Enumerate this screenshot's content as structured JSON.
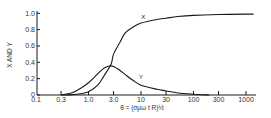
{
  "chart_data": {
    "type": "line",
    "title": "",
    "xlabel": "θ = (σμω t R)½",
    "ylabel": "X AND Y",
    "xscale": "log",
    "xlim": [
      0.1,
      1500
    ],
    "ylim": [
      0,
      1.0
    ],
    "grid": false,
    "legend": "inline labels",
    "x_ticks": [
      0.1,
      0.3,
      1.0,
      3.0,
      10,
      30,
      100,
      300,
      1000
    ],
    "x_tick_labels": [
      "0.1",
      "0.3",
      "1.0",
      "3.0",
      "10",
      "30",
      "100",
      "300",
      "1000"
    ],
    "y_ticks": [
      0,
      0.2,
      0.4,
      0.6,
      0.8,
      1.0
    ],
    "y_tick_labels": [
      "0",
      "0.2",
      "0.4",
      "0.6",
      "0.8",
      "1.0"
    ],
    "series": [
      {
        "name": "X",
        "label_at": [
          11,
          0.93
        ],
        "x": [
          0.3,
          0.5,
          0.7,
          1.0,
          1.5,
          2.0,
          2.7,
          3.0,
          4.0,
          5.0,
          7.0,
          10,
          20,
          30,
          50,
          100,
          300,
          1000,
          1400
        ],
        "values": [
          0.0,
          0.005,
          0.015,
          0.04,
          0.12,
          0.24,
          0.38,
          0.5,
          0.65,
          0.76,
          0.83,
          0.88,
          0.925,
          0.94,
          0.96,
          0.975,
          0.985,
          0.99,
          0.99
        ]
      },
      {
        "name": "Y",
        "label_at": [
          10,
          0.19
        ],
        "x": [
          0.3,
          0.5,
          0.7,
          1.0,
          1.5,
          2.0,
          2.5,
          3.0,
          4.0,
          5.0,
          7.0,
          10,
          20,
          30,
          50,
          100,
          200
        ],
        "values": [
          0.0,
          0.03,
          0.08,
          0.15,
          0.26,
          0.33,
          0.355,
          0.35,
          0.3,
          0.25,
          0.18,
          0.12,
          0.07,
          0.05,
          0.025,
          0.01,
          0.0
        ]
      }
    ]
  }
}
